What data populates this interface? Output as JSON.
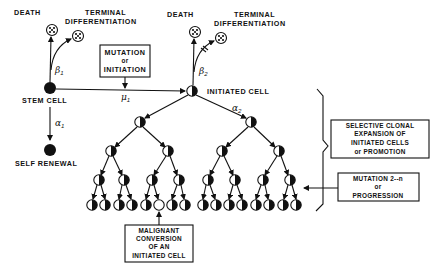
{
  "diagram": {
    "type": "cell-lineage-carcinogenesis-model",
    "stem_cell": {
      "label": "STEM CELL",
      "death_label": "DEATH",
      "terminal_diff_label_1": "TERMINAL",
      "terminal_diff_label_2": "DIFFERENTIATION",
      "beta": "β",
      "beta_sub": "1",
      "alpha": "α",
      "alpha_sub": "1",
      "self_renewal_label": "SELF RENEWAL"
    },
    "mutation_box": {
      "line1": "MUTATION",
      "line2": "or",
      "line3": "INITIATION",
      "mu": "μ",
      "mu_sub": "1"
    },
    "initiated_cell": {
      "label": "INITIATED CELL",
      "death_label": "DEATH",
      "terminal_diff_label_1": "TERMINAL",
      "terminal_diff_label_2": "DIFFERENTIATION",
      "beta": "β",
      "beta_sub": "2",
      "alpha": "α",
      "alpha_sub": "2"
    },
    "clonal_expansion_box": {
      "line1": "SELECTIVE CLONAL",
      "line2": "EXPANSION OF",
      "line3": "INITIATED CELLS",
      "line4": "or PROMOTION"
    },
    "progression_box": {
      "line1": "MUTATION 2--n",
      "line2": "or",
      "line3": "PROGRESSION"
    },
    "malignant_box": {
      "line1": "MALIGNANT",
      "line2": "CONVERSION",
      "line3": "OF AN",
      "line4": "INITIATED CELL"
    },
    "tree": {
      "levels": 5,
      "leaf_count": 16,
      "malignant_leaf_index": 5
    },
    "colors": {
      "ink": "#111111",
      "background": "#ffffff"
    }
  }
}
